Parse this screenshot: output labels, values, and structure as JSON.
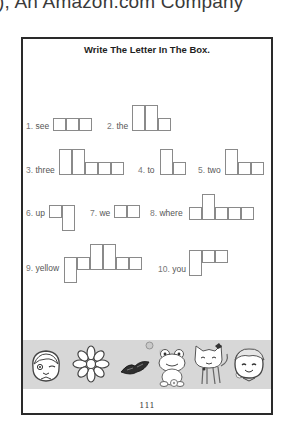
{
  "header": {
    "caption": "), An Amazon.com Company"
  },
  "worksheet": {
    "title": "Write The Letter In The Box.",
    "page_number": "111",
    "items": [
      {
        "num": "1.",
        "word": "see"
      },
      {
        "num": "2.",
        "word": "the"
      },
      {
        "num": "3.",
        "word": "three"
      },
      {
        "num": "4.",
        "word": "to"
      },
      {
        "num": "5.",
        "word": "two"
      },
      {
        "num": "6.",
        "word": "up"
      },
      {
        "num": "7.",
        "word": "we"
      },
      {
        "num": "8.",
        "word": "where"
      },
      {
        "num": "9.",
        "word": "yellow"
      },
      {
        "num": "10.",
        "word": "you"
      }
    ]
  },
  "banner": {
    "illustrations": [
      "girl-face",
      "flower",
      "butterfly",
      "frog",
      "cat",
      "boy-face"
    ]
  }
}
